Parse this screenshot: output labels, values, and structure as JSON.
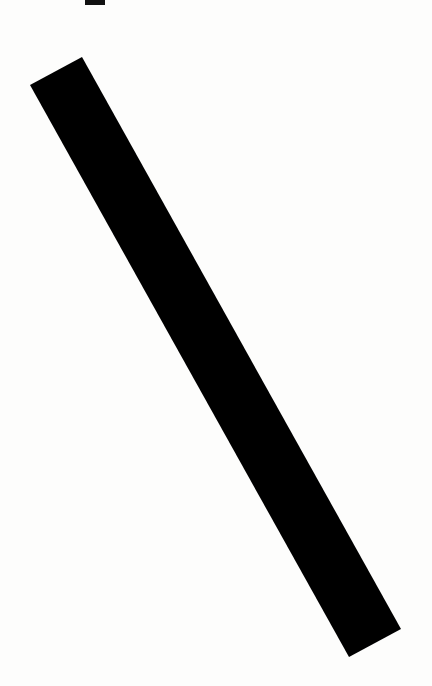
{
  "image": {
    "description": "Scanned white sheet with a thick black diagonal stripe",
    "background_color": "#fdfdfc",
    "stripe_color": "#000000",
    "stripe_polygon": [
      [
        30,
        85
      ],
      [
        82,
        57
      ],
      [
        401,
        629
      ],
      [
        349,
        657
      ]
    ],
    "top_mark": {
      "x": 85,
      "y": 0,
      "width": 20,
      "height": 5,
      "color": "#111111"
    }
  }
}
